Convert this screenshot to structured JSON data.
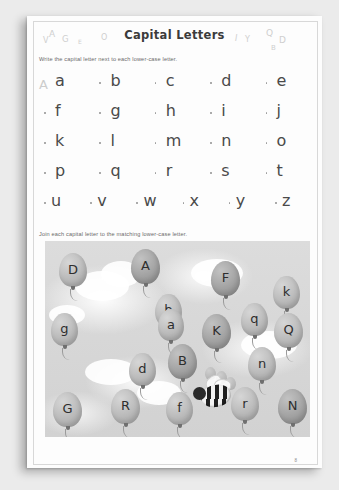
{
  "page": {
    "title": "Capital Letters",
    "page_number": "8",
    "background_color": "#ebebeb",
    "paper_color": "#fdfdfd"
  },
  "decorative_letters": {
    "left": [
      "V",
      "A",
      "G",
      "E",
      "O"
    ],
    "right": [
      "I",
      "Y",
      "Q",
      "D",
      "B"
    ]
  },
  "exercise1": {
    "instruction": "Write the capital letter next to each lower-case letter.",
    "example_capital": "A",
    "rows": [
      [
        "a",
        "b",
        "c",
        "d",
        "e"
      ],
      [
        "f",
        "g",
        "h",
        "i",
        "j"
      ],
      [
        "k",
        "l",
        "m",
        "n",
        "o"
      ],
      [
        "p",
        "q",
        "r",
        "s",
        "t"
      ],
      [
        "u",
        "v",
        "w",
        "x",
        "y",
        "z"
      ]
    ]
  },
  "exercise2": {
    "instruction": "Join each capital letter to the matching lower-case letter.",
    "balloons": [
      {
        "label": "D",
        "x": 14,
        "y": 12,
        "w": 28,
        "h": 34,
        "shade": "light"
      },
      {
        "label": "A",
        "x": 86,
        "y": 8,
        "w": 29,
        "h": 35,
        "shade": "dark"
      },
      {
        "label": "b",
        "x": 110,
        "y": 53,
        "w": 27,
        "h": 33,
        "shade": "light"
      },
      {
        "label": "g",
        "x": 6,
        "y": 72,
        "w": 27,
        "h": 33,
        "shade": "light"
      },
      {
        "label": "a",
        "x": 113,
        "y": 68,
        "w": 26,
        "h": 32,
        "shade": "light"
      },
      {
        "label": "F",
        "x": 166,
        "y": 20,
        "w": 29,
        "h": 35,
        "shade": "dark"
      },
      {
        "label": "k",
        "x": 228,
        "y": 35,
        "w": 27,
        "h": 33,
        "shade": "light"
      },
      {
        "label": "K",
        "x": 157,
        "y": 73,
        "w": 29,
        "h": 35,
        "shade": "dark"
      },
      {
        "label": "q",
        "x": 196,
        "y": 62,
        "w": 27,
        "h": 33,
        "shade": "light"
      },
      {
        "label": "Q",
        "x": 229,
        "y": 72,
        "w": 29,
        "h": 35,
        "shade": "light"
      },
      {
        "label": "d",
        "x": 84,
        "y": 112,
        "w": 27,
        "h": 33,
        "shade": "light"
      },
      {
        "label": "B",
        "x": 123,
        "y": 103,
        "w": 29,
        "h": 35,
        "shade": "dark"
      },
      {
        "label": "n",
        "x": 203,
        "y": 106,
        "w": 28,
        "h": 34,
        "shade": "light"
      },
      {
        "label": "G",
        "x": 8,
        "y": 151,
        "w": 29,
        "h": 35,
        "shade": "light"
      },
      {
        "label": "R",
        "x": 66,
        "y": 148,
        "w": 29,
        "h": 35,
        "shade": "light"
      },
      {
        "label": "f",
        "x": 121,
        "y": 151,
        "w": 27,
        "h": 33,
        "shade": "light"
      },
      {
        "label": "r",
        "x": 186,
        "y": 146,
        "w": 28,
        "h": 34,
        "shade": "light"
      },
      {
        "label": "N",
        "x": 233,
        "y": 148,
        "w": 29,
        "h": 35,
        "shade": "dark"
      }
    ],
    "character": "bee-with-balloons"
  }
}
